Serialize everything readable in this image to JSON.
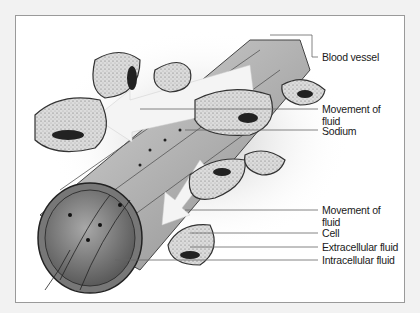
{
  "diagram": {
    "labels": {
      "blood_vessel": "Blood vessel",
      "movement_of_fluid_top_line1": "Movement of",
      "movement_of_fluid_top_line2": "fluid",
      "sodium": "Sodium",
      "movement_of_fluid_bottom_line1": "Movement of",
      "movement_of_fluid_bottom_line2": "fluid",
      "cell": "Cell",
      "extracellular_fluid": "Extracellular fluid",
      "intracellular_fluid": "Intracellular fluid"
    },
    "colors": {
      "background": "#f2f2f2",
      "panel": "#ffffff",
      "ink": "#1a1a1a",
      "vessel": "#9a9a9a",
      "cell_fill": "#d6d6d6"
    }
  }
}
